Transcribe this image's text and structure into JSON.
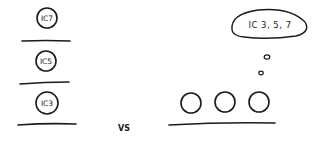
{
  "left_stack": {
    "items": [
      {
        "label": "IC7"
      },
      {
        "label": "IC5"
      },
      {
        "label": "IC3"
      }
    ]
  },
  "separator": {
    "label": "VS"
  },
  "right_group": {
    "circle_count": 3,
    "thought_bubble": {
      "label": "IC 3, 5, 7"
    }
  },
  "colors": {
    "ink": "#1a1a1a",
    "background": "#ffffff"
  }
}
